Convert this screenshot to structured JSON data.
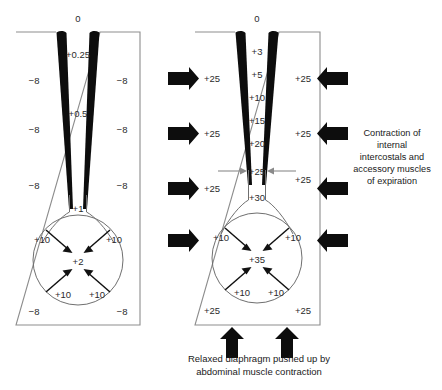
{
  "figure": {
    "title_left": "0",
    "title_right": "0",
    "bottom_caption_line1": "Relaxed diaphragm pushed up by",
    "bottom_caption_line2": "abdominal muscle contraction",
    "side_annotation_lines": [
      "Contraction of",
      "internal",
      "intercostals and",
      "accessory muscles",
      "of expiration"
    ]
  },
  "left_panel": {
    "name": "passive-expiration",
    "mouth_pressure": "0",
    "airway_values": [
      "+0.25",
      "+0.5"
    ],
    "pleural_values_left": [
      "−8",
      "−8",
      "−8",
      "−8"
    ],
    "pleural_values_right": [
      "−8",
      "−8",
      "−8",
      "−8"
    ],
    "bronchus_value": "+1",
    "alveolar_value": "+2",
    "diaphragm_values": [
      "+10",
      "+10",
      "+10",
      "+10"
    ]
  },
  "right_panel": {
    "name": "forced-expiration",
    "mouth_pressure": "0",
    "airway_values": [
      "+3",
      "+5",
      "+10",
      "+15",
      "+20",
      "+25",
      "+30"
    ],
    "compression_point_value": "+25",
    "pleural_values_left": [
      "+25",
      "+25",
      "+25",
      "+25"
    ],
    "pleural_values_right": [
      "+25",
      "+25",
      "+25",
      "+25"
    ],
    "alveolar_value": "+35",
    "diaphragm_values": [
      "+10",
      "+10",
      "+10",
      "+10"
    ]
  },
  "colors": {
    "ink": "#0d0d0d",
    "box_stroke": "#8d8d8d",
    "gray_arrow": "#8a8a8a",
    "text": "#2b2b2b"
  }
}
